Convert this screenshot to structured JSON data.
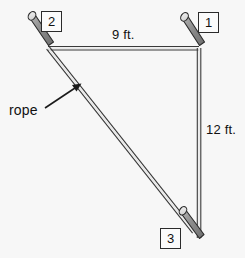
{
  "figure": {
    "background_color": "#f7f7f7",
    "rope_color": "#3a3a3a",
    "stake_color": "#8a8a8a",
    "stake_outline_color": "#2b2b2b",
    "text_color": "#111111"
  },
  "dimensions": {
    "top_label": "9 ft.",
    "right_label": "12 ft."
  },
  "annotation": {
    "rope_label": "rope"
  },
  "posts": [
    {
      "id": "1",
      "label": "1"
    },
    {
      "id": "2",
      "label": "2"
    },
    {
      "id": "3",
      "label": "3"
    }
  ]
}
